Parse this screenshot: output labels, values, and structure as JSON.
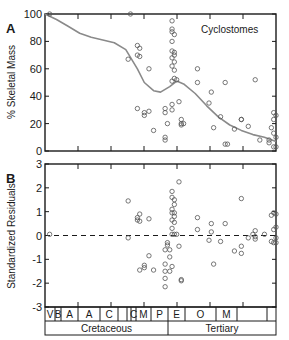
{
  "figure": {
    "panel_a_label": "A",
    "panel_b_label": "B",
    "annotation": "Cyclostomes"
  },
  "chart_data": [
    {
      "type": "scatter",
      "panel": "A",
      "title": "",
      "annotation": "Cyclostomes",
      "xlabel": "Cretaceous / Tertiary geologic stages",
      "ylabel": "% Skeletal Mass",
      "ylim": [
        0,
        100
      ],
      "yticks": [
        0,
        20,
        40,
        60,
        80,
        100
      ],
      "xlim": [
        0,
        100
      ],
      "grid": false,
      "trend_line": {
        "name": "smoothed fit",
        "color": "#8a8a8a",
        "x": [
          0,
          5,
          10,
          15,
          20,
          25,
          30,
          35,
          40,
          43,
          47,
          50,
          54,
          57,
          60,
          65,
          70,
          75,
          80,
          85,
          90,
          95,
          100
        ],
        "y": [
          100,
          96,
          91,
          86,
          83,
          81,
          79,
          74,
          60,
          50,
          44,
          43,
          47,
          51,
          49,
          42,
          33,
          25,
          19,
          15,
          12,
          10,
          7
        ]
      },
      "points": [
        [
          2,
          100
        ],
        [
          37,
          100
        ],
        [
          36,
          67
        ],
        [
          40,
          77
        ],
        [
          41,
          75
        ],
        [
          40,
          70
        ],
        [
          41,
          69
        ],
        [
          45,
          60
        ],
        [
          40,
          31
        ],
        [
          43,
          26
        ],
        [
          43,
          28
        ],
        [
          45,
          29
        ],
        [
          47,
          15
        ],
        [
          52,
          31
        ],
        [
          52,
          28
        ],
        [
          53,
          20
        ],
        [
          52,
          10
        ],
        [
          52,
          8
        ],
        [
          55,
          95
        ],
        [
          55,
          89
        ],
        [
          55,
          87
        ],
        [
          56,
          85
        ],
        [
          55,
          80
        ],
        [
          55,
          73
        ],
        [
          56,
          72
        ],
        [
          56,
          70
        ],
        [
          55,
          68
        ],
        [
          56,
          65
        ],
        [
          55,
          62
        ],
        [
          56,
          59
        ],
        [
          56,
          53
        ],
        [
          55,
          51
        ],
        [
          57,
          52
        ],
        [
          55,
          34
        ],
        [
          55,
          30
        ],
        [
          58,
          36
        ],
        [
          59,
          23
        ],
        [
          59,
          20
        ],
        [
          59,
          19
        ],
        [
          60,
          20
        ],
        [
          66,
          60
        ],
        [
          66,
          50
        ],
        [
          71,
          35
        ],
        [
          72,
          43
        ],
        [
          76,
          25
        ],
        [
          78,
          50
        ],
        [
          73,
          17
        ],
        [
          78,
          5
        ],
        [
          79,
          5
        ],
        [
          82,
          16
        ],
        [
          85,
          23
        ],
        [
          85,
          23
        ],
        [
          88,
          18
        ],
        [
          91,
          52
        ],
        [
          93,
          8
        ],
        [
          97,
          8
        ],
        [
          97,
          6
        ],
        [
          98,
          17
        ],
        [
          99,
          23
        ],
        [
          99,
          28
        ],
        [
          100,
          26
        ],
        [
          99,
          13
        ],
        [
          100,
          10
        ],
        [
          99,
          3
        ],
        [
          100,
          3
        ]
      ]
    },
    {
      "type": "scatter",
      "panel": "B",
      "title": "",
      "xlabel": "Cretaceous / Tertiary geologic stages",
      "ylabel": "Standardized Residuals",
      "ylim": [
        -3,
        3
      ],
      "yticks": [
        -3,
        -2,
        -1,
        0,
        1,
        2,
        3
      ],
      "reference_line": {
        "y": 0,
        "style": "dashed"
      },
      "grid": false,
      "points": [
        [
          2,
          0.05
        ],
        [
          36,
          1.45
        ],
        [
          36,
          -0.1
        ],
        [
          40,
          0.75
        ],
        [
          41,
          0.9
        ],
        [
          40,
          0.65
        ],
        [
          41,
          0.6
        ],
        [
          45,
          0.7
        ],
        [
          41,
          -1.45
        ],
        [
          43,
          -1.35
        ],
        [
          43,
          -1.25
        ],
        [
          45,
          -0.85
        ],
        [
          47,
          -1.45
        ],
        [
          52,
          -1.2
        ],
        [
          52,
          -1.5
        ],
        [
          53,
          -0.4
        ],
        [
          52,
          -1.8
        ],
        [
          52,
          -2.15
        ],
        [
          52,
          -0.6
        ],
        [
          53,
          -0.3
        ],
        [
          54,
          -0.6
        ],
        [
          54,
          -0.9
        ],
        [
          55,
          -1.3
        ],
        [
          54,
          -1.5
        ],
        [
          55,
          1.85
        ],
        [
          55,
          1.6
        ],
        [
          56,
          1.5
        ],
        [
          56,
          1.3
        ],
        [
          55,
          1.1
        ],
        [
          55,
          0.95
        ],
        [
          56,
          0.95
        ],
        [
          56,
          0.8
        ],
        [
          55,
          0.65
        ],
        [
          56,
          0.55
        ],
        [
          55,
          0.3
        ],
        [
          56,
          0.05
        ],
        [
          55,
          0.05
        ],
        [
          57,
          0.05
        ],
        [
          58,
          2.25
        ],
        [
          58,
          -0.45
        ],
        [
          59,
          -1.85
        ],
        [
          59,
          -1.9
        ],
        [
          66,
          0.75
        ],
        [
          66,
          0.25
        ],
        [
          71,
          -0.2
        ],
        [
          72,
          0.5
        ],
        [
          72,
          0.15
        ],
        [
          76,
          -0.25
        ],
        [
          78,
          0.5
        ],
        [
          73,
          -1.2
        ],
        [
          82,
          -0.65
        ],
        [
          85,
          1.55
        ],
        [
          85,
          -0.45
        ],
        [
          85,
          -0.75
        ],
        [
          88,
          -0.1
        ],
        [
          90,
          0.05
        ],
        [
          91,
          0.2
        ],
        [
          91,
          -0.05
        ],
        [
          91,
          -0.15
        ],
        [
          95,
          0.05
        ],
        [
          98,
          0.85
        ],
        [
          99,
          0.95
        ],
        [
          100,
          0.9
        ],
        [
          99,
          0.25
        ],
        [
          100,
          -0.1
        ],
        [
          98,
          -0.25
        ],
        [
          99,
          -0.3
        ],
        [
          100,
          -0.3
        ],
        [
          100,
          0.35
        ]
      ]
    }
  ],
  "timescale": {
    "stages": [
      "V",
      "B",
      "A",
      "A",
      "C",
      "",
      "",
      "C",
      "M",
      "P",
      "E",
      "O",
      "M",
      "",
      ""
    ],
    "periods": [
      "Cretaceous",
      "Tertiary"
    ]
  }
}
